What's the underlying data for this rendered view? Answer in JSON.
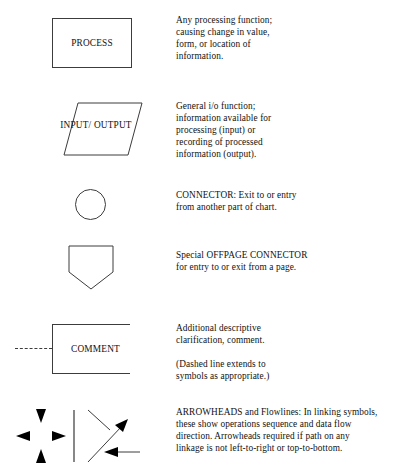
{
  "document": {
    "title": "Flowchart Symbols Legend"
  },
  "rows": [
    {
      "symbol_name": "process-symbol",
      "symbol_label": "PROCESS",
      "descriptions": [
        "Any processing function;\ncausing change in value,\nform, or location of\ninformation."
      ]
    },
    {
      "symbol_name": "input-output-symbol",
      "symbol_label": "INPUT/\nOUTPUT",
      "descriptions": [
        "General i/o function;\ninformation available for\nprocessing (input) or\nrecording of processed\ninformation (output)."
      ]
    },
    {
      "symbol_name": "connector-symbol",
      "symbol_label": "",
      "descriptions": [
        "CONNECTOR: Exit to or entry\nfrom another part of chart."
      ]
    },
    {
      "symbol_name": "offpage-connector-symbol",
      "symbol_label": "",
      "descriptions": [
        "Special OFFPAGE CONNECTOR\nfor entry to or exit from a page."
      ]
    },
    {
      "symbol_name": "comment-symbol",
      "symbol_label": "COMMENT",
      "descriptions": [
        "Additional descriptive\nclarification, comment.",
        "(Dashed line extends to\nsymbols as appropriate.)"
      ]
    },
    {
      "symbol_name": "arrowheads-symbol",
      "symbol_label": "",
      "descriptions": [
        "ARROWHEADS and Flowlines: In linking symbols,\nthese show operations sequence and data flow\ndirection. Arrowheads required if path on any\nlinkage is not left-to-right or top-to-bottom."
      ]
    }
  ],
  "colors": {
    "stroke": "#3c3c3c",
    "arrow_fill": "#000000",
    "text": "#111111",
    "background": "#ffffff"
  }
}
